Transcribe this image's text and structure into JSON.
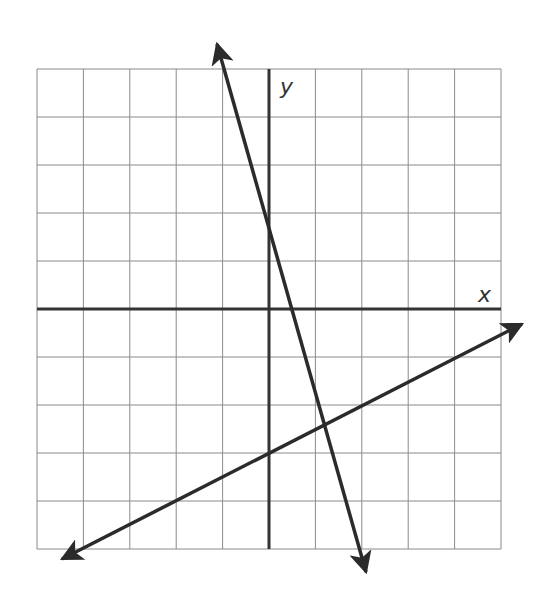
{
  "chart_data": {
    "type": "line",
    "title": "",
    "xlabel": "x",
    "ylabel": "y",
    "grid": true,
    "xlim": [
      -5,
      5
    ],
    "ylim": [
      -5,
      5
    ],
    "tick_labels": false,
    "series": [
      {
        "name": "steep-line",
        "description": "Decreasing line with arrows at both ends",
        "slope": -3.4,
        "y_intercept": 1.6,
        "x_intercept": 0.5,
        "endpoints": [
          [
            -1.16,
            5.7
          ],
          [
            2.13,
            -5.6
          ]
        ]
      },
      {
        "name": "shallow-line",
        "description": "Increasing line with arrows at both ends",
        "slope": 0.5,
        "y_intercept": -3,
        "x_intercept": 6,
        "endpoints": [
          [
            -4.6,
            -5.3
          ],
          [
            5.6,
            -0.2
          ]
        ]
      }
    ],
    "intersection": [
      1.2,
      -2.4
    ]
  },
  "colors": {
    "grid": "#8a8a8a",
    "axis": "#333333",
    "line": "#2b2b2b"
  },
  "labels": {
    "x_axis": "x",
    "y_axis": "y"
  }
}
